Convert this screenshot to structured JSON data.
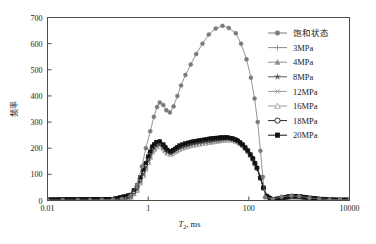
{
  "chart_data": {
    "type": "line",
    "title": "",
    "xlabel": "T₂,  ms",
    "ylabel": "频率",
    "xscale": "log",
    "xlim": [
      0.01,
      10000
    ],
    "ylim": [
      0,
      700
    ],
    "grid": false,
    "legend_position": "top-right",
    "x_tick_labels": [
      "0.01",
      "1",
      "100",
      "10000"
    ],
    "x_tick_values": [
      0.01,
      1,
      100,
      10000
    ],
    "y_tick_labels": [
      "0",
      "100",
      "200",
      "300",
      "400",
      "500",
      "600",
      "700"
    ],
    "y_tick_values": [
      0,
      100,
      200,
      300,
      400,
      500,
      600,
      700
    ],
    "series": [
      {
        "name": "饱和状态",
        "marker": "filled-circle",
        "color": "#7a7a7a",
        "x": [
          0.01,
          0.02,
          0.04,
          0.07,
          0.12,
          0.2,
          0.3,
          0.45,
          0.6,
          0.75,
          0.9,
          1.1,
          1.3,
          1.5,
          1.7,
          2.0,
          2.3,
          2.7,
          3.2,
          3.8,
          4.5,
          5.5,
          7,
          9,
          12,
          16,
          22,
          30,
          40,
          55,
          70,
          90,
          110,
          130,
          150,
          170,
          190,
          210,
          300,
          450,
          700,
          1000,
          1600,
          2500,
          4000,
          6500,
          10000
        ],
        "y": [
          2,
          2,
          2,
          2,
          3,
          4,
          6,
          18,
          60,
          130,
          200,
          265,
          320,
          358,
          375,
          365,
          345,
          337,
          360,
          400,
          440,
          480,
          520,
          560,
          600,
          635,
          658,
          668,
          660,
          640,
          600,
          540,
          470,
          390,
          300,
          190,
          90,
          12,
          6,
          14,
          18,
          16,
          10,
          6,
          4,
          3,
          3
        ]
      },
      {
        "name": "3MPa",
        "marker": "plus",
        "color": "#8e8e8e",
        "x": [
          0.01,
          0.2,
          0.45,
          0.6,
          0.8,
          1.0,
          1.2,
          1.45,
          1.7,
          2.0,
          2.4,
          2.8,
          3.4,
          4.2,
          5.5,
          7,
          9,
          12,
          16,
          22,
          30,
          38,
          48,
          60,
          75,
          95,
          120,
          145,
          170,
          195,
          230,
          300,
          450,
          700,
          1000,
          1600,
          2500,
          4000,
          6500,
          10000
        ],
        "y": [
          2,
          3,
          12,
          38,
          95,
          145,
          185,
          205,
          208,
          198,
          182,
          178,
          186,
          196,
          204,
          210,
          214,
          218,
          222,
          226,
          230,
          232,
          230,
          224,
          210,
          188,
          160,
          125,
          86,
          48,
          16,
          4,
          8,
          14,
          13,
          8,
          5,
          3,
          2,
          2
        ]
      },
      {
        "name": "4MPa",
        "marker": "filled-triangle",
        "color": "#8e8e8e",
        "x": [
          0.01,
          0.2,
          0.45,
          0.6,
          0.8,
          1.0,
          1.2,
          1.45,
          1.7,
          2.0,
          2.4,
          2.8,
          3.4,
          4.2,
          5.5,
          7,
          9,
          12,
          16,
          22,
          30,
          38,
          48,
          60,
          75,
          95,
          120,
          145,
          170,
          195,
          230,
          300,
          450,
          700,
          1000,
          1600,
          2500,
          4000,
          6500,
          10000
        ],
        "y": [
          2,
          3,
          13,
          40,
          98,
          148,
          188,
          208,
          210,
          200,
          183,
          179,
          188,
          198,
          206,
          212,
          216,
          220,
          224,
          228,
          232,
          234,
          232,
          226,
          212,
          190,
          161,
          126,
          87,
          49,
          16,
          4,
          8,
          14,
          13,
          8,
          5,
          3,
          2,
          2
        ]
      },
      {
        "name": "8MPa",
        "marker": "filled-star",
        "color": "#5a5a5a",
        "x": [
          0.01,
          0.2,
          0.45,
          0.6,
          0.8,
          1.0,
          1.2,
          1.45,
          1.7,
          2.0,
          2.4,
          2.8,
          3.4,
          4.2,
          5.5,
          7,
          9,
          12,
          16,
          22,
          30,
          38,
          48,
          60,
          75,
          95,
          120,
          145,
          170,
          195,
          230,
          300,
          450,
          700,
          1000,
          1600,
          2500,
          4000,
          6500,
          10000
        ],
        "y": [
          2,
          3,
          14,
          42,
          100,
          150,
          190,
          210,
          212,
          202,
          184,
          180,
          189,
          199,
          207,
          213,
          217,
          221,
          225,
          229,
          233,
          235,
          233,
          227,
          213,
          191,
          162,
          127,
          88,
          50,
          17,
          4,
          9,
          15,
          14,
          9,
          5,
          3,
          2,
          2
        ]
      },
      {
        "name": "12MPa",
        "marker": "cross",
        "color": "#9a9a9a",
        "x": [
          0.01,
          0.2,
          0.45,
          0.6,
          0.8,
          1.0,
          1.2,
          1.45,
          1.7,
          2.0,
          2.4,
          2.8,
          3.4,
          4.2,
          5.5,
          7,
          9,
          12,
          16,
          22,
          30,
          38,
          48,
          60,
          75,
          95,
          120,
          145,
          170,
          195,
          230,
          300,
          450,
          700,
          1000,
          1600,
          2500,
          4000,
          6500,
          10000
        ],
        "y": [
          2,
          3,
          12,
          39,
          96,
          146,
          186,
          206,
          209,
          199,
          181,
          177,
          187,
          197,
          205,
          211,
          215,
          219,
          223,
          227,
          231,
          233,
          231,
          225,
          211,
          189,
          160,
          125,
          86,
          48,
          16,
          3,
          8,
          13,
          12,
          8,
          5,
          3,
          2,
          2
        ]
      },
      {
        "name": "16MPa",
        "marker": "open-triangle",
        "color": "#9a9a9a",
        "x": [
          0.01,
          0.2,
          0.45,
          0.6,
          0.8,
          1.0,
          1.2,
          1.45,
          1.7,
          2.0,
          2.4,
          2.8,
          3.4,
          4.2,
          5.5,
          7,
          9,
          12,
          16,
          22,
          30,
          38,
          48,
          60,
          75,
          95,
          120,
          145,
          170,
          195,
          230,
          300,
          450,
          700,
          1000,
          1600,
          2500,
          4000,
          6500,
          10000
        ],
        "y": [
          2,
          3,
          12,
          38,
          94,
          144,
          184,
          204,
          207,
          197,
          180,
          176,
          185,
          195,
          203,
          209,
          213,
          217,
          221,
          225,
          229,
          231,
          229,
          223,
          209,
          187,
          158,
          123,
          85,
          47,
          15,
          3,
          8,
          13,
          12,
          8,
          5,
          3,
          2,
          2
        ]
      },
      {
        "name": "18MPa",
        "marker": "open-circle",
        "color": "#2b2b2b",
        "x": [
          0.01,
          0.2,
          0.45,
          0.6,
          0.8,
          1.0,
          1.2,
          1.45,
          1.7,
          2.0,
          2.4,
          2.8,
          3.4,
          4.2,
          5.5,
          7,
          9,
          12,
          16,
          22,
          30,
          38,
          48,
          60,
          75,
          95,
          120,
          145,
          170,
          195,
          230,
          300,
          450,
          700,
          1000,
          1600,
          2500,
          4000,
          6500,
          10000
        ],
        "y": [
          2,
          4,
          18,
          52,
          112,
          163,
          202,
          221,
          224,
          212,
          192,
          186,
          196,
          208,
          216,
          222,
          226,
          230,
          234,
          238,
          240,
          240,
          236,
          228,
          213,
          190,
          160,
          124,
          86,
          48,
          15,
          3,
          9,
          16,
          15,
          9,
          5,
          3,
          2,
          2
        ]
      },
      {
        "name": "20MPa",
        "marker": "filled-square",
        "color": "#111111",
        "x": [
          0.01,
          0.2,
          0.45,
          0.6,
          0.8,
          1.0,
          1.2,
          1.45,
          1.7,
          2.0,
          2.4,
          2.8,
          3.4,
          4.2,
          5.5,
          7,
          9,
          12,
          16,
          22,
          30,
          38,
          48,
          60,
          75,
          95,
          120,
          145,
          170,
          195,
          230,
          300,
          450,
          700,
          1000,
          1600,
          2500,
          4000,
          6500,
          10000
        ],
        "y": [
          3,
          5,
          22,
          58,
          118,
          168,
          206,
          224,
          226,
          214,
          194,
          188,
          198,
          210,
          218,
          224,
          228,
          232,
          236,
          239,
          241,
          241,
          237,
          229,
          214,
          191,
          161,
          125,
          87,
          49,
          16,
          3,
          10,
          17,
          16,
          10,
          6,
          3,
          2,
          2
        ]
      }
    ]
  },
  "legend": {
    "items": [
      {
        "label": "饱和状态"
      },
      {
        "label": "3MPa"
      },
      {
        "label": "4MPa"
      },
      {
        "label": "8MPa"
      },
      {
        "label": "12MPa"
      },
      {
        "label": "16MPa"
      },
      {
        "label": "18MPa"
      },
      {
        "label": "20MPa"
      }
    ]
  },
  "axes": {
    "x_title_main": "T",
    "x_title_sub": "2",
    "x_title_rest": ",  ms",
    "y_title": "频率"
  }
}
